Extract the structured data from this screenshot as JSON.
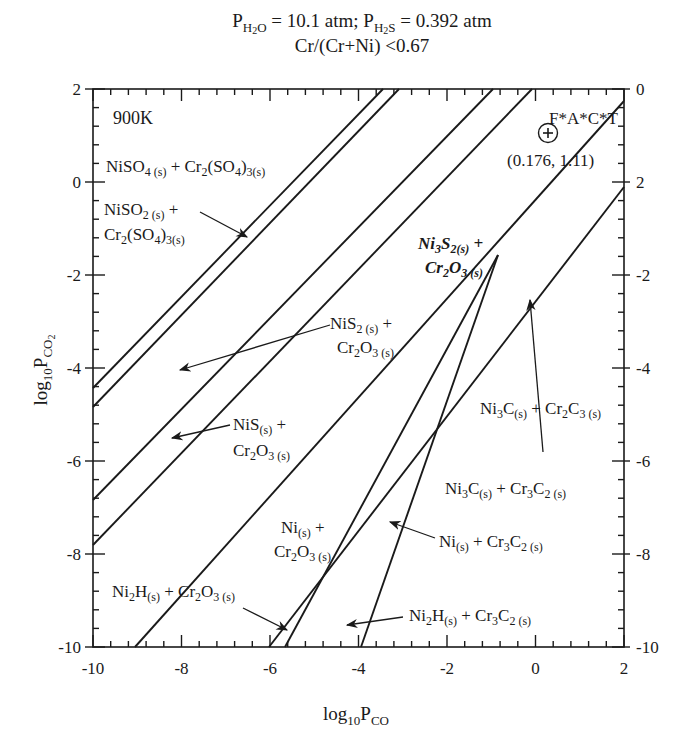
{
  "header": {
    "line1": "P_H2O = 10.1 atm; P_H2S = 0.392 atm",
    "line1_parts": {
      "p": "P",
      "h2o_sub": "H",
      "h2o_sub2": "2",
      "h2o_sub3": "O",
      "eq1": " = 10.1 atm; P",
      "h2s_sub": "H",
      "h2s_sub2": "2",
      "h2s_sub3": "S",
      "eq2": " = 0.392 atm"
    },
    "line2": "Cr/(Cr+Ni) <0.67"
  },
  "chart_data": {
    "type": "line",
    "temperature_label": "900K",
    "xlabel": "log10 P_CO",
    "ylabel": "log10 P_CO2",
    "xlim": [
      -10,
      2
    ],
    "ylim": [
      -10,
      2
    ],
    "x_ticks": [
      "-10",
      "-8",
      "-6",
      "-4",
      "-2",
      "0",
      "2"
    ],
    "y_ticks_left": [
      "2",
      "0",
      "-2",
      "-4",
      "-6",
      "-8",
      "-10"
    ],
    "y_ticks_right": [
      "0",
      "2",
      "-2",
      "-4",
      "-6",
      "-8",
      "-10"
    ],
    "grid": false,
    "series": [
      {
        "name": "boundary-1",
        "x": [
          -10,
          -4.8
        ],
        "y": [
          -4.4,
          2
        ]
      },
      {
        "name": "boundary-2",
        "x": [
          -10,
          -4.45
        ],
        "y": [
          -4.85,
          2
        ]
      },
      {
        "name": "boundary-3",
        "x": [
          -10,
          -2.3
        ],
        "y": [
          -6.85,
          2
        ]
      },
      {
        "name": "boundary-4",
        "x": [
          -10,
          -1.45
        ],
        "y": [
          -7.8,
          2
        ]
      },
      {
        "name": "boundary-5",
        "x": [
          -9.05,
          2
        ],
        "y": [
          -10,
          1.75
        ]
      },
      {
        "name": "boundary-6",
        "x": [
          -6.0,
          2
        ],
        "y": [
          -10,
          -0.2
        ]
      },
      {
        "name": "boundary-7",
        "x": [
          -5.6,
          -0.8
        ],
        "y": [
          -10,
          -1.55
        ]
      },
      {
        "name": "boundary-8",
        "x": [
          -3.95,
          -0.8
        ],
        "y": [
          -10,
          -1.55
        ]
      }
    ],
    "annotations": [
      {
        "text": "F*A*C*T",
        "x": 0.176,
        "y": 1.11
      },
      {
        "text": "(0.176, 1.11)",
        "x": 0.176,
        "y": 1.11
      }
    ],
    "regions": [
      "NiSO4(s) + Cr2(SO4)3(s)",
      "NiSO2(s) + Cr2(SO4)3(s)",
      "NiS2(s) + Cr2O3(s)",
      "NiS(s) + Cr2O3(s)",
      "Ni3S2(s) + Cr2O3(s)",
      "Ni3C(s) + Cr2C3(s)",
      "Ni3C(s) + Cr3C2(s)",
      "Ni(s) + Cr2O3(s)",
      "Ni(s) + Cr3C2(s)",
      "Ni2H(s) + Cr2O3(s)",
      "Ni2H(s) + Cr3C2(s)"
    ]
  },
  "labels": {
    "temp": "900K",
    "fact": "F*A*C*T",
    "fact_coords": "(0.176, 1.11)",
    "xaxis_log": "log",
    "xaxis_10": "10",
    "xaxis_P": "P",
    "xaxis_sub": "CO",
    "yaxis_log": "log",
    "yaxis_10": "10",
    "yaxis_P": "P",
    "yaxis_sub": "CO",
    "yaxis_sub2": "2"
  }
}
